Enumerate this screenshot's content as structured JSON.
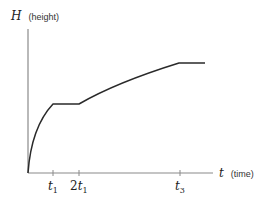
{
  "diagram": {
    "y_axis": {
      "symbol": "H",
      "unit_label": "(height)"
    },
    "x_axis": {
      "symbol": "t",
      "unit_label": "(time)"
    },
    "ticks": [
      {
        "label_prefix": "",
        "symbol": "t",
        "subscript": "1"
      },
      {
        "label_prefix": "2",
        "symbol": "t",
        "subscript": "1"
      },
      {
        "label_prefix": "",
        "symbol": "t",
        "subscript": "3"
      }
    ],
    "segments": [
      "concave rise from origin to t1",
      "flat plateau from t1 to 2t1",
      "concave rise from 2t1 to t3",
      "flat plateau after t3"
    ],
    "colors": {
      "axis": "#8a8a8a",
      "curve": "#2a2a2a"
    }
  }
}
